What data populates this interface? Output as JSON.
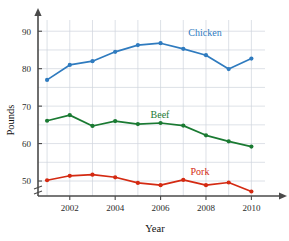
{
  "chart_data": {
    "type": "line",
    "title": "",
    "xlabel": "Year",
    "ylabel": "Pounds",
    "x": [
      2001,
      2002,
      2003,
      2004,
      2005,
      2006,
      2007,
      2008,
      2009,
      2010
    ],
    "xtick_labels": [
      "2002",
      "2004",
      "2006",
      "2008",
      "2010"
    ],
    "xticks": [
      2002,
      2004,
      2006,
      2008,
      2010
    ],
    "yticks": [
      50,
      60,
      70,
      80,
      90
    ],
    "ytick_labels": [
      "50",
      "60",
      "70",
      "80",
      "90"
    ],
    "ylim": [
      46,
      93
    ],
    "xlim": [
      2000.6,
      2010.6
    ],
    "y_axis_break": true,
    "grid": true,
    "legend_position": "inline-annotations",
    "series": [
      {
        "name": "Chicken",
        "color": "#2f7bbf",
        "label_text": "Chicken",
        "values": [
          77.0,
          81.0,
          82.0,
          84.5,
          86.3,
          86.8,
          85.3,
          83.6,
          79.9,
          82.7
        ]
      },
      {
        "name": "Beef",
        "color": "#1a7a32",
        "label_text": "Beef",
        "values": [
          66.1,
          67.6,
          64.7,
          66.0,
          65.2,
          65.5,
          64.8,
          62.2,
          60.6,
          59.2
        ]
      },
      {
        "name": "Pork",
        "color": "#d42a12",
        "label_text": "Pork",
        "values": [
          50.2,
          51.4,
          51.7,
          51.0,
          49.5,
          48.9,
          50.3,
          48.9,
          49.6,
          47.2
        ]
      }
    ]
  }
}
